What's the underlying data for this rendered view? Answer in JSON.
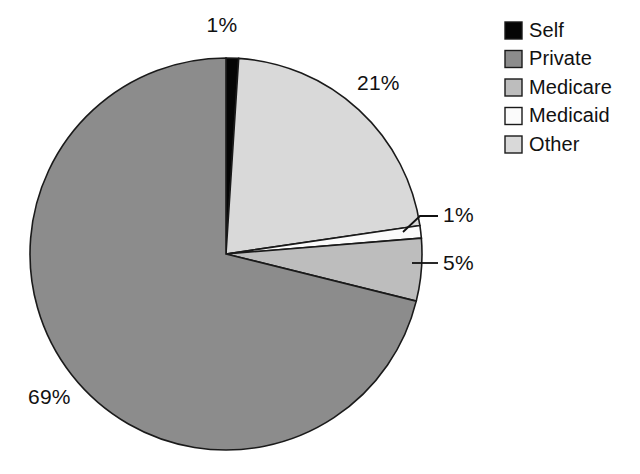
{
  "chart_data": {
    "type": "pie",
    "title": "",
    "subtitle": "",
    "xlabel": "",
    "ylabel": "",
    "grid": false,
    "legend_position": "right-top",
    "units": "percent",
    "start_angle_deg": 0,
    "direction": "clockwise",
    "categories": [
      "Self",
      "Private",
      "Medicare",
      "Medicaid",
      "Other"
    ],
    "values": [
      1,
      69,
      5,
      1,
      21
    ],
    "slice_order_clockwise_from_top": [
      "Self",
      "Other",
      "Medicaid",
      "Medicare",
      "Private"
    ],
    "slices": [
      {
        "name": "Self",
        "label": "1%",
        "value": 1,
        "color": "#050505",
        "label_x": 222,
        "label_y": 32,
        "anchor": "middle",
        "leader": null
      },
      {
        "name": "Other",
        "label": "21%",
        "value": 21,
        "color": "#d9d9d9",
        "label_x": 357,
        "label_y": 90,
        "anchor": "start",
        "leader": null
      },
      {
        "name": "Medicaid",
        "label": "1%",
        "value": 1,
        "color": "#fbfbfb",
        "label_x": 443,
        "label_y": 222,
        "anchor": "start",
        "leader": "M 403,232 L 420,216 L 438,216"
      },
      {
        "name": "Medicare",
        "label": "5%",
        "value": 5,
        "color": "#bdbdbd",
        "label_x": 443,
        "label_y": 270,
        "anchor": "start",
        "leader": "M 412,263 L 438,263"
      },
      {
        "name": "Private",
        "label": "69%",
        "value": 69,
        "color": "#8c8c8c",
        "label_x": 28,
        "label_y": 404,
        "anchor": "start",
        "leader": null
      }
    ]
  },
  "legend": {
    "items": [
      {
        "label": "Self",
        "color": "#050505"
      },
      {
        "label": "Private",
        "color": "#8c8c8c"
      },
      {
        "label": "Medicare",
        "color": "#bdbdbd"
      },
      {
        "label": "Medicaid",
        "color": "#fbfbfb"
      },
      {
        "label": "Other",
        "color": "#d9d9d9"
      }
    ]
  },
  "geometry": {
    "center_x": 226,
    "center_y": 254,
    "radius": 196
  }
}
